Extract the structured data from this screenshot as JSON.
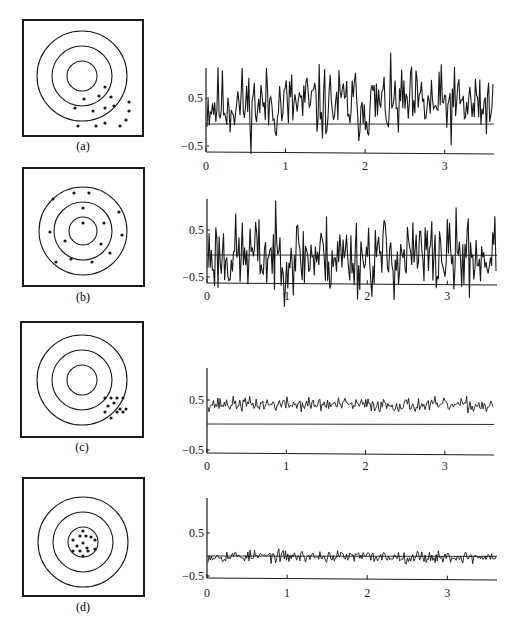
{
  "figure": {
    "ink_color": "#1a1a1a",
    "background": "#ffffff",
    "panels": [
      {
        "id": "a",
        "label": "(a)",
        "target": {
          "box": [
            23,
            20,
            120,
            116
          ],
          "center": [
            82,
            76
          ],
          "ring_radii": [
            15,
            30,
            45
          ],
          "dots": [
            [
              105,
              87
            ],
            [
              84,
              99
            ],
            [
              99,
              96
            ],
            [
              111,
              97
            ],
            [
              75,
              108
            ],
            [
              93,
              111
            ],
            [
              105,
              108
            ],
            [
              114,
              106
            ],
            [
              129,
              102
            ],
            [
              129,
              111
            ],
            [
              126,
              120
            ],
            [
              78,
              126
            ],
            [
              96,
              126
            ],
            [
              105,
              123
            ],
            [
              120,
              126
            ]
          ]
        },
        "plot": {
          "origin_x": 206,
          "x_end": 494,
          "axis_top": 68,
          "y_zero": 124,
          "y_half": 98,
          "y_neg_half": 146,
          "baseline": 152,
          "tick_label_y": 170,
          "mean": 0.42,
          "spread": 0.38,
          "zero_line_slope": 0.004,
          "seed": 11
        }
      },
      {
        "id": "b",
        "label": "(b)",
        "target": {
          "box": [
            23,
            168,
            121,
            118
          ],
          "center": [
            83,
            231
          ],
          "ring_radii": [
            14,
            29,
            44
          ],
          "dots": [
            [
              83,
              223
            ],
            [
              83,
              208
            ],
            [
              104,
              223
            ],
            [
              65,
              241
            ],
            [
              50,
              232
            ],
            [
              53,
              199
            ],
            [
              74,
              193
            ],
            [
              89,
              193
            ],
            [
              119,
              212
            ],
            [
              122,
              235
            ],
            [
              110,
              253
            ],
            [
              101,
              244
            ],
            [
              92,
              262
            ],
            [
              71,
              259
            ],
            [
              56,
              262
            ]
          ]
        },
        "plot": {
          "origin_x": 207,
          "x_end": 497,
          "axis_top": 199,
          "y_zero": 255,
          "y_half": 230,
          "y_neg_half": 277,
          "baseline": 283,
          "tick_label_y": 300,
          "mean": 0.0,
          "spread": 0.42,
          "zero_line_slope": 0.01,
          "seed": 23
        }
      },
      {
        "id": "c",
        "label": "(c)",
        "target": {
          "box": [
            21,
            322,
            122,
            115
          ],
          "center": [
            82,
            380
          ],
          "ring_radii": [
            15,
            30,
            45
          ],
          "dots": [
            [
              105,
              398
            ],
            [
              111,
              398
            ],
            [
              117,
              398
            ],
            [
              123,
              398
            ],
            [
              108,
              406
            ],
            [
              114,
              403
            ],
            [
              120,
              409
            ],
            [
              126,
              409
            ],
            [
              105,
              412
            ],
            [
              117,
              412
            ],
            [
              111,
              418
            ],
            [
              123,
              412
            ]
          ]
        },
        "plot": {
          "origin_x": 207,
          "x_end": 494,
          "axis_top": 368,
          "y_zero": 424,
          "y_half": 400,
          "y_neg_half": 450,
          "baseline": 453,
          "tick_label_y": 470,
          "mean": 0.4,
          "spread": 0.07,
          "zero_line_slope": 0.016,
          "seed": 37
        }
      },
      {
        "id": "d",
        "label": "(d)",
        "target": {
          "box": [
            23,
            478,
            121,
            118
          ],
          "center": [
            83,
            542
          ],
          "ring_radii": [
            15,
            30,
            45
          ],
          "dots": [
            [
              83,
              531
            ],
            [
              80,
              536
            ],
            [
              86,
              536
            ],
            [
              91,
              537
            ],
            [
              95,
              540
            ],
            [
              73,
              540
            ],
            [
              77,
              546
            ],
            [
              83,
              543
            ],
            [
              87,
              548
            ],
            [
              95,
              549
            ],
            [
              73,
              551
            ],
            [
              80,
              551
            ],
            [
              88,
              551
            ],
            [
              83,
              556
            ]
          ]
        },
        "plot": {
          "origin_x": 207,
          "x_end": 497,
          "axis_top": 498,
          "y_zero": 556,
          "y_half": 533,
          "y_neg_half": 576,
          "baseline": 578,
          "tick_label_y": 597,
          "mean": 0.0,
          "spread": 0.07,
          "zero_line_slope": 0.015,
          "seed": 53
        }
      }
    ],
    "axis": {
      "y_tick_labels": [
        "0.5",
        "−0.5"
      ],
      "x_tick_labels": [
        "0",
        "1",
        "2",
        "3"
      ],
      "x_tick_values": [
        0,
        1,
        2,
        3
      ],
      "x_max": 3.62
    }
  },
  "chart_data": [
    {
      "type": "line",
      "title": "(a)",
      "xlabel": "",
      "ylabel": "",
      "x_ticks": [
        0,
        1,
        2,
        3
      ],
      "y_ticks": [
        0.5,
        -0.5
      ],
      "xlim": [
        0,
        3.6
      ],
      "ylim": [
        -0.6,
        0.9
      ],
      "description": "noisy signal, mean ~0.4, large variance (low precision, low accuracy)",
      "mean": 0.42,
      "range": [
        0.0,
        0.8
      ]
    },
    {
      "type": "line",
      "title": "(b)",
      "xlabel": "",
      "ylabel": "",
      "x_ticks": [
        0,
        1,
        2,
        3
      ],
      "y_ticks": [
        0.5,
        -0.5
      ],
      "xlim": [
        0,
        3.6
      ],
      "ylim": [
        -0.6,
        0.9
      ],
      "description": "noisy signal centered at 0, large variance (accurate, imprecise)",
      "mean": 0.0,
      "range": [
        -0.45,
        0.45
      ]
    },
    {
      "type": "line",
      "title": "(c)",
      "xlabel": "",
      "ylabel": "",
      "x_ticks": [
        0,
        1,
        2,
        3
      ],
      "y_ticks": [
        0.5,
        -0.5
      ],
      "xlim": [
        0,
        3.6
      ],
      "ylim": [
        -0.6,
        0.9
      ],
      "description": "low-noise signal offset at ~0.4 (precise, biased)",
      "mean": 0.4,
      "range": [
        0.33,
        0.47
      ]
    },
    {
      "type": "line",
      "title": "(d)",
      "xlabel": "",
      "ylabel": "",
      "x_ticks": [
        0,
        1,
        2,
        3
      ],
      "y_ticks": [
        0.5,
        -0.5
      ],
      "xlim": [
        0,
        3.6
      ],
      "ylim": [
        -0.6,
        0.9
      ],
      "description": "low-noise signal centered at 0 (precise and accurate)",
      "mean": 0.0,
      "range": [
        -0.07,
        0.07
      ]
    }
  ]
}
